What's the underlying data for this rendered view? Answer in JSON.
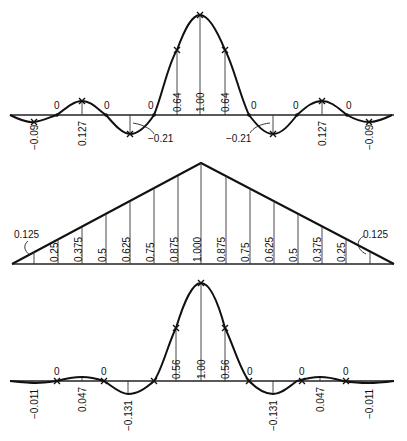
{
  "panels": {
    "top": {
      "title": "Sinc-like response (top)",
      "ordinates": [
        "-0.09",
        "0.127",
        "-0.21",
        "0.64",
        "1.00",
        "0.64",
        "-0.21",
        "0.127",
        "-0.09"
      ],
      "zero_labels": [
        "0",
        "0",
        "0",
        "0",
        "0",
        "0"
      ],
      "labels": {
        "l_m009": "−0.09",
        "l_0127": "0.127",
        "l_m021": "−0.21",
        "c_064a": "0.64",
        "c_100": "1.00",
        "c_064b": "0.64",
        "r_m021": "−0.21",
        "r_0127": "0.127",
        "r_m009": "−0.09",
        "z": "0"
      }
    },
    "middle": {
      "title": "Triangular window",
      "values": [
        "0.125",
        "0.25",
        "0.375",
        "0.5",
        "0.625",
        "0.75",
        "0.875",
        "1.000",
        "0.875",
        "0.75",
        "0.625",
        "0.5",
        "0.375",
        "0.25",
        "0.125"
      ],
      "labels": {
        "v0": "0.125",
        "v1": "0.25",
        "v2": "0.375",
        "v3": "0.5",
        "v4": "0.625",
        "v5": "0.75",
        "v6": "0.875",
        "v7": "1.000",
        "v8": "0.875",
        "v9": "0.75",
        "v10": "0.625",
        "v11": "0.5",
        "v12": "0.375",
        "v13": "0.25",
        "v14": "0.125"
      }
    },
    "bottom": {
      "title": "Windowed response (bottom)",
      "ordinates": [
        "-0.011",
        "0.047",
        "-0.131",
        "0.56",
        "1.00",
        "0.56",
        "-0.131",
        "0.047",
        "-0.011"
      ],
      "labels": {
        "l_m0011": "−0.011",
        "l_0047": "0.047",
        "l_m0131": "−0.131",
        "c_056a": "0.56",
        "c_100": "1.00",
        "c_056b": "0.56",
        "r_m0131": "−0.131",
        "r_0047": "0.047",
        "r_m0011": "−0.011",
        "z": "0"
      }
    }
  }
}
